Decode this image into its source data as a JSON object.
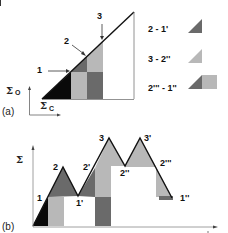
{
  "colors": {
    "black": "#0a0a0a",
    "dark_gray": "#6a6a6a",
    "light_gray": "#b8b8b8",
    "line": "#111111",
    "axis": "#666666"
  },
  "panel_a": {
    "label": "(a)",
    "y_axis_label": "Σ",
    "y_axis_sub": "O",
    "x_axis_label": "Σ",
    "x_axis_sub": "C",
    "points": [
      {
        "label": "1"
      },
      {
        "label": "2"
      },
      {
        "label": "3"
      }
    ],
    "legend": [
      {
        "label": "2 - 1'",
        "swatch": "dark-triangle"
      },
      {
        "label": "3 - 2''",
        "swatch": "light-triangle"
      },
      {
        "label": "2''' - 1''",
        "swatch": "dark-triangle-plus-light-square"
      }
    ]
  },
  "panel_b": {
    "label": "(b)",
    "y_axis_label": "Σ",
    "points": [
      {
        "label": "1"
      },
      {
        "label": "2"
      },
      {
        "label": "1'"
      },
      {
        "label": "2'"
      },
      {
        "label": "3"
      },
      {
        "label": "2''"
      },
      {
        "label": "3'"
      },
      {
        "label": "2'''"
      },
      {
        "label": "1''"
      }
    ]
  }
}
